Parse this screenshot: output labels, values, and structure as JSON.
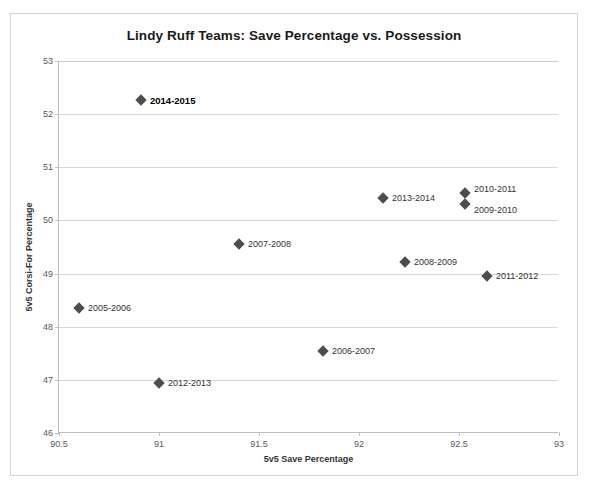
{
  "chart_data": {
    "type": "scatter",
    "title": "Lindy Ruff Teams: Save Percentage vs. Possession",
    "xlabel": "5v5 Save Percentage",
    "ylabel": "5v5 Corsi-For Percentage",
    "xlim": [
      90.5,
      93
    ],
    "ylim": [
      46,
      53
    ],
    "xticks": [
      "90.5",
      "91",
      "91.5",
      "92",
      "92.5",
      "93"
    ],
    "xtick_values": [
      90.5,
      91,
      91.5,
      92,
      92.5,
      93
    ],
    "yticks": [
      "46",
      "47",
      "48",
      "49",
      "50",
      "51",
      "52",
      "53"
    ],
    "ytick_values": [
      46,
      47,
      48,
      49,
      50,
      51,
      52,
      53
    ],
    "grid": "horizontal",
    "legend": "none",
    "marker": "diamond",
    "marker_color": "#4d4d4d",
    "points": [
      {
        "label": "2014-2015",
        "x": 90.91,
        "y": 52.27,
        "label_pos": "right",
        "emphasis": true
      },
      {
        "label": "2005-2006",
        "x": 90.6,
        "y": 48.35,
        "label_pos": "right",
        "emphasis": false
      },
      {
        "label": "2012-2013",
        "x": 91.0,
        "y": 46.95,
        "label_pos": "right",
        "emphasis": false
      },
      {
        "label": "2007-2008",
        "x": 91.4,
        "y": 49.55,
        "label_pos": "right",
        "emphasis": false
      },
      {
        "label": "2006-2007",
        "x": 91.82,
        "y": 47.55,
        "label_pos": "right",
        "emphasis": false
      },
      {
        "label": "2013-2014",
        "x": 92.12,
        "y": 50.42,
        "label_pos": "right",
        "emphasis": false
      },
      {
        "label": "2008-2009",
        "x": 92.23,
        "y": 49.22,
        "label_pos": "right",
        "emphasis": false
      },
      {
        "label": "2010-2011",
        "x": 92.53,
        "y": 50.52,
        "label_pos": "above",
        "emphasis": false
      },
      {
        "label": "2009-2010",
        "x": 92.53,
        "y": 50.31,
        "label_pos": "below",
        "emphasis": false
      },
      {
        "label": "2011-2012",
        "x": 92.64,
        "y": 48.95,
        "label_pos": "right",
        "emphasis": false
      }
    ]
  }
}
